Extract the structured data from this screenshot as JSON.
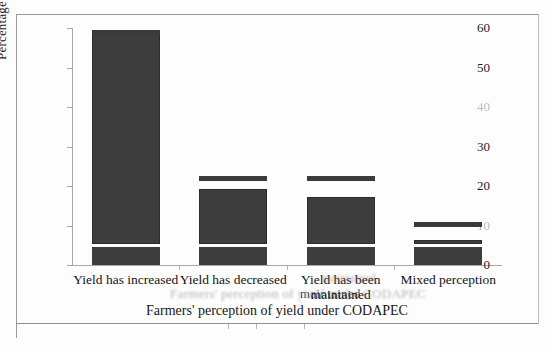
{
  "chart_data": {
    "type": "bar",
    "title": "",
    "xlabel": "Farmers' perception of yield under CODAPEC",
    "ylabel": "Percentage of respondents",
    "categories": [
      "Yield has increased",
      "Yield has decreased",
      "Yield has been maintained",
      "Mixed perception"
    ],
    "category_lines": [
      [
        "Yield has increased"
      ],
      [
        "Yield has decreased"
      ],
      [
        "Yield has been",
        "maintained"
      ],
      [
        "Mixed perception"
      ]
    ],
    "values": [
      58.7,
      19.3,
      17.1,
      6.4
    ],
    "cap_values": [
      59.5,
      22.5,
      22.5,
      10.8
    ],
    "base_segment_value": 4.6,
    "ylim": [
      0,
      60
    ],
    "yticks": [
      0,
      10,
      20,
      30,
      40,
      50,
      60
    ],
    "ytick_labels": [
      "0",
      "10",
      "20",
      "30",
      "40",
      "50",
      "60"
    ],
    "ytick_faint": [
      false,
      true,
      false,
      false,
      true,
      false,
      false
    ],
    "grid": false,
    "legend": "none",
    "bar_color": "#3d3d3d",
    "axis_color": "#a9a9a9"
  },
  "figure": {
    "ghost_text_center": "Farmers' perception of yield under CODAPEC",
    "ghost_text_overlap": "maintained",
    "ghost_text_small": "maintained"
  }
}
